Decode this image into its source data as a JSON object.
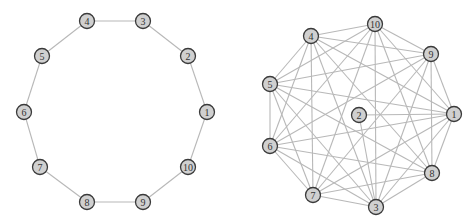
{
  "style": {
    "node_fill": "#d0d0d0",
    "node_stroke": "#3a3a3a",
    "edge_color": "#b8b8b8",
    "node_radius": 7.5
  },
  "graphs": [
    {
      "name": "cycle-graph",
      "nodes": [
        {
          "id": "1",
          "x": 207,
          "y": 112
        },
        {
          "id": "2",
          "x": 188,
          "y": 56
        },
        {
          "id": "3",
          "x": 143,
          "y": 21
        },
        {
          "id": "4",
          "x": 87,
          "y": 21
        },
        {
          "id": "5",
          "x": 42,
          "y": 56
        },
        {
          "id": "6",
          "x": 24,
          "y": 112
        },
        {
          "id": "7",
          "x": 40,
          "y": 167
        },
        {
          "id": "8",
          "x": 87,
          "y": 202
        },
        {
          "id": "9",
          "x": 143,
          "y": 202
        },
        {
          "id": "10",
          "x": 188,
          "y": 167
        }
      ],
      "edges": [
        [
          "1",
          "2"
        ],
        [
          "2",
          "3"
        ],
        [
          "3",
          "4"
        ],
        [
          "4",
          "5"
        ],
        [
          "5",
          "6"
        ],
        [
          "6",
          "7"
        ],
        [
          "7",
          "8"
        ],
        [
          "8",
          "9"
        ],
        [
          "9",
          "10"
        ],
        [
          "10",
          "1"
        ]
      ]
    },
    {
      "name": "dense-graph",
      "nodes": [
        {
          "id": "1",
          "x": 454,
          "y": 114
        },
        {
          "id": "2",
          "x": 359,
          "y": 115
        },
        {
          "id": "3",
          "x": 376,
          "y": 207
        },
        {
          "id": "4",
          "x": 311,
          "y": 36
        },
        {
          "id": "5",
          "x": 270,
          "y": 84
        },
        {
          "id": "6",
          "x": 270,
          "y": 146
        },
        {
          "id": "7",
          "x": 313,
          "y": 195
        },
        {
          "id": "8",
          "x": 432,
          "y": 173
        },
        {
          "id": "9",
          "x": 431,
          "y": 54
        },
        {
          "id": "10",
          "x": 375,
          "y": 24
        }
      ],
      "edges": [
        [
          "2",
          "1"
        ],
        [
          "2",
          "3"
        ],
        [
          "1",
          "3"
        ],
        [
          "1",
          "4"
        ],
        [
          "1",
          "5"
        ],
        [
          "1",
          "6"
        ],
        [
          "1",
          "7"
        ],
        [
          "1",
          "8"
        ],
        [
          "1",
          "9"
        ],
        [
          "1",
          "10"
        ],
        [
          "3",
          "4"
        ],
        [
          "3",
          "5"
        ],
        [
          "3",
          "6"
        ],
        [
          "3",
          "7"
        ],
        [
          "3",
          "8"
        ],
        [
          "3",
          "9"
        ],
        [
          "3",
          "10"
        ],
        [
          "4",
          "5"
        ],
        [
          "4",
          "6"
        ],
        [
          "4",
          "7"
        ],
        [
          "4",
          "8"
        ],
        [
          "4",
          "9"
        ],
        [
          "4",
          "10"
        ],
        [
          "5",
          "6"
        ],
        [
          "5",
          "7"
        ],
        [
          "5",
          "8"
        ],
        [
          "5",
          "9"
        ],
        [
          "5",
          "10"
        ],
        [
          "6",
          "7"
        ],
        [
          "6",
          "8"
        ],
        [
          "6",
          "9"
        ],
        [
          "6",
          "10"
        ],
        [
          "7",
          "8"
        ],
        [
          "7",
          "9"
        ],
        [
          "7",
          "10"
        ],
        [
          "8",
          "9"
        ],
        [
          "8",
          "10"
        ],
        [
          "9",
          "10"
        ]
      ]
    }
  ]
}
